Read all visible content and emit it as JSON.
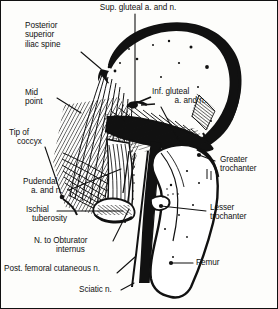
{
  "figure": {
    "type": "anatomical-line-diagram",
    "border_color": "#111111",
    "ink_color": "#111111",
    "background_color": "#fdfdfb"
  },
  "labels": [
    {
      "id": "sup-gluteal",
      "name": "sup-gluteal-vessels-label",
      "line1": "Sup. gluteal a. and n.",
      "line2": "",
      "align": "center",
      "x": 72,
      "y": 3
    },
    {
      "id": "psis",
      "name": "posterior-superior-iliac-spine-label",
      "line1": "Posterior",
      "line2": "superior",
      "line3": "iliac spine",
      "align": "left",
      "x": 24,
      "y": 21
    },
    {
      "id": "mid-point",
      "name": "mid-point-label",
      "line1": "Mid",
      "line2": "point",
      "align": "left",
      "x": 24,
      "y": 88
    },
    {
      "id": "inf-gluteal",
      "name": "inf-gluteal-vessels-label",
      "line1": "Inf. gluteal",
      "line2": "a. and n.",
      "align": "left",
      "x": 152,
      "y": 86
    },
    {
      "id": "tip-coccyx",
      "name": "tip-of-coccyx-label",
      "line1": "Tip of",
      "line2": "coccyx",
      "align": "left",
      "x": 8,
      "y": 128
    },
    {
      "id": "greater-troch",
      "name": "greater-trochanter-label",
      "line1": "Greater",
      "line2": "trochanter",
      "align": "left",
      "x": 216,
      "y": 155
    },
    {
      "id": "pudendal",
      "name": "pudendal-vessels-label",
      "line1": "Pudendal",
      "line2": "a. and n.",
      "align": "left",
      "x": 22,
      "y": 177
    },
    {
      "id": "lesser-troch",
      "name": "lesser-trochanter-label",
      "line1": "Lesser",
      "line2": "trochanter",
      "align": "left",
      "x": 207,
      "y": 203
    },
    {
      "id": "ischial-tub",
      "name": "ischial-tuberosity-label",
      "line1": "Ischial",
      "line2": "tuberosity",
      "align": "left",
      "x": 28,
      "y": 205
    },
    {
      "id": "n-obturator",
      "name": "nerve-to-obturator-internus-label",
      "line1": "N. to Obturator",
      "line2": "internus",
      "align": "left",
      "x": 33,
      "y": 236
    },
    {
      "id": "post-fem-cut",
      "name": "posterior-femoral-cutaneous-nerve-label",
      "line1": "Post. femoral cutaneous n.",
      "line2": "",
      "align": "left",
      "x": 3,
      "y": 264
    },
    {
      "id": "femur",
      "name": "femur-label",
      "line1": "Femur",
      "line2": "",
      "align": "left",
      "x": 193,
      "y": 258
    },
    {
      "id": "sciatic",
      "name": "sciatic-nerve-label",
      "line1": "Sciatic n.",
      "line2": "",
      "align": "left",
      "x": 78,
      "y": 285
    }
  ],
  "structures": [
    {
      "name": "ilium-iliac-crest",
      "description": "large rounded iliac blade, upper right"
    },
    {
      "name": "gluteus-medius-hatching",
      "description": "fan of hatched muscle fibers"
    },
    {
      "name": "piriformis-muscle",
      "description": "central wedge muscle band"
    },
    {
      "name": "sacrotuberous-ligament",
      "description": "vertical striated band"
    },
    {
      "name": "sciatic-nerve-trunk",
      "description": "thick black vertical nerve cord"
    },
    {
      "name": "femur-shaft",
      "description": "long bone descending to lower right"
    },
    {
      "name": "greater-trochanter-bone",
      "description": "bony prominence upper femur"
    },
    {
      "name": "lesser-trochanter-bone",
      "description": "small medial bony knob"
    },
    {
      "name": "ischial-tuberosity-bone",
      "description": "ischial bone lower medial"
    },
    {
      "name": "coccyx-tip",
      "description": "lower sacral tip, left"
    }
  ]
}
